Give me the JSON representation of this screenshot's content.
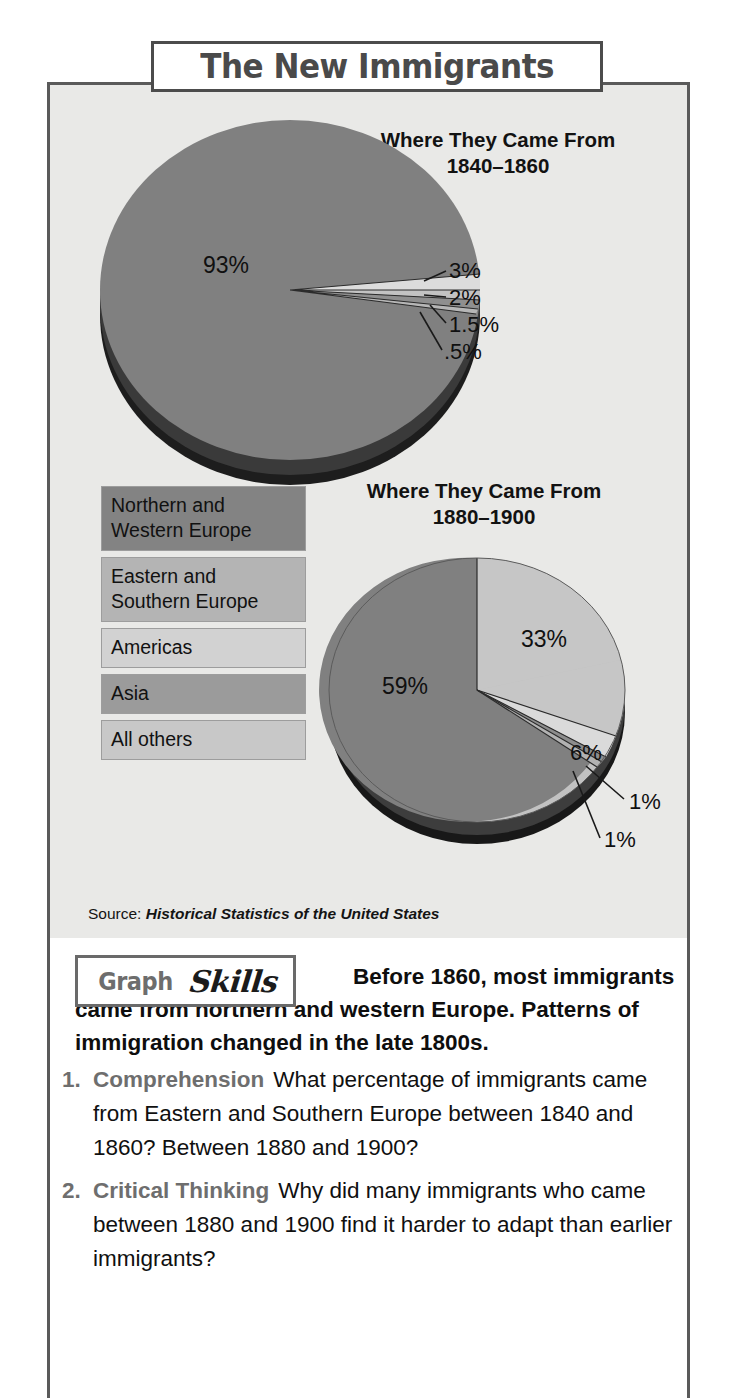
{
  "banner": {
    "title": "The New Immigrants"
  },
  "chart_data": [
    {
      "type": "pie",
      "title": "Where They Came From",
      "subtitle": "1840–1860",
      "categories": [
        "Northern and Western Europe",
        "Eastern and Southern Europe",
        "Americas",
        "Asia",
        "All others"
      ],
      "values": [
        93,
        3,
        2,
        1.5,
        0.5
      ],
      "labels": [
        "93%",
        "3%",
        "2%",
        "1.5%",
        ".5%"
      ],
      "colors": [
        "#808080",
        "#d4d4d4",
        "#bdbdbd",
        "#9a9a9a",
        "#c6c6c6"
      ],
      "legend": "left",
      "ylabel": "",
      "xlabel": ""
    },
    {
      "type": "pie",
      "title": "Where They Came From",
      "subtitle": "1880–1900",
      "categories": [
        "Northern and Western Europe",
        "Eastern and Southern Europe",
        "Americas",
        "Asia",
        "All others"
      ],
      "values": [
        59,
        33,
        6,
        1,
        1
      ],
      "labels": [
        "59%",
        "33%",
        "6%",
        "1%",
        "1%"
      ],
      "colors": [
        "#808080",
        "#c2c2c2",
        "#d6d6d6",
        "#8e8e8e",
        "#b0b0b0"
      ],
      "legend": "left",
      "ylabel": "",
      "xlabel": ""
    }
  ],
  "pies": [
    {
      "heading": "Where They Came From",
      "years": "1840–1860",
      "labels": {
        "p93": "93%",
        "p3": "3%",
        "p2": "2%",
        "p15": "1.5%",
        "p05": ".5%"
      }
    },
    {
      "heading": "Where They Came From",
      "years": "1880–1900",
      "labels": {
        "p59": "59%",
        "p33": "33%",
        "p6": "6%",
        "p1a": "1%",
        "p1b": "1%"
      }
    }
  ],
  "legend": {
    "items": [
      {
        "label": "Northern and\nWestern Europe",
        "color": "#838383"
      },
      {
        "label": "Eastern and\nSouthern Europe",
        "color": "#b4b4b4"
      },
      {
        "label": "Americas",
        "color": "#d2d2d2"
      },
      {
        "label": "Asia",
        "color": "#9b9b9b"
      },
      {
        "label": "All others",
        "color": "#c8c8c8"
      }
    ]
  },
  "source": {
    "prefix": "Source: ",
    "title": "Historical Statistics of the United States"
  },
  "skills": {
    "word_graph": "Graph",
    "word_skills": "Skills",
    "caption": "Before 1860, most immigrants came from northern and western Europe. Patterns of immigration changed in the late 1800s."
  },
  "questions": [
    {
      "num": "1.",
      "kind": "Comprehension",
      "text": "What percentage of immigrants came from Eastern and Southern Europe between 1840 and 1860? Between 1880 and 1900?"
    },
    {
      "num": "2.",
      "kind": "Critical Thinking",
      "text": "Why did many immigrants who came between 1880 and 1900 find it harder to adapt than earlier immigrants?"
    }
  ]
}
